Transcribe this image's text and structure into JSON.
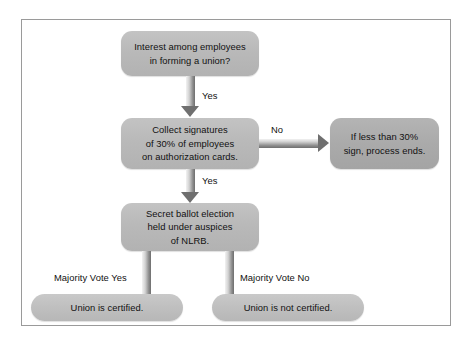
{
  "diagram": {
    "frame_border_color": "#9a9a9a",
    "background_color": "#ffffff",
    "node_fill_color": "#bcbcbc",
    "arrow_color": "#6f6f6f",
    "nodes": [
      {
        "id": "interest",
        "lines": [
          "Interest among employees",
          "in forming a union?"
        ]
      },
      {
        "id": "collect",
        "lines": [
          "Collect signatures",
          "of 30% of employees",
          "on authorization cards."
        ]
      },
      {
        "id": "process-ends",
        "lines": [
          "If less than 30%",
          "sign, process ends."
        ]
      },
      {
        "id": "election",
        "lines": [
          "Secret ballot election",
          "held under auspices",
          "of NLRB."
        ]
      },
      {
        "id": "certified",
        "lines": [
          "Union is certified."
        ]
      },
      {
        "id": "not-certified",
        "lines": [
          "Union is not certified."
        ]
      }
    ],
    "edge_labels": {
      "interest_to_collect": "Yes",
      "collect_to_process_ends": "No",
      "collect_to_election": "Yes",
      "election_to_certified": "Majority Vote Yes",
      "election_to_not_certified": "Majority Vote No"
    }
  }
}
